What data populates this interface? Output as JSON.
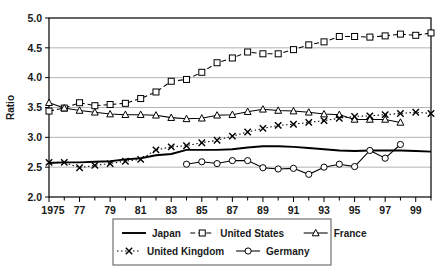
{
  "chart_data": {
    "type": "line",
    "title": "",
    "xlabel": "",
    "ylabel": "Ratio",
    "xlim": [
      1975,
      2000
    ],
    "ylim": [
      2.0,
      5.0
    ],
    "grid": true,
    "legend_position": "bottom",
    "ytick_labels": [
      "5.0",
      "4.5",
      "4.0",
      "3.5",
      "3.0",
      "2.5",
      "2.0"
    ],
    "yticks": [
      5.0,
      4.5,
      4.0,
      3.5,
      3.0,
      2.5,
      2.0
    ],
    "xtick_labels": [
      "1975",
      "77",
      "79",
      "81",
      "83",
      "85",
      "87",
      "89",
      "91",
      "93",
      "95",
      "97",
      "99"
    ],
    "xticks": [
      1975,
      1977,
      1979,
      1981,
      1983,
      1985,
      1987,
      1989,
      1991,
      1993,
      1995,
      1997,
      1999
    ],
    "xticks_minor": [
      1976,
      1978,
      1980,
      1982,
      1984,
      1986,
      1988,
      1990,
      1992,
      1994,
      1996,
      1998,
      2000
    ],
    "series": [
      {
        "name": "Japan",
        "style": "solid",
        "marker": "none",
        "color": "#000000",
        "x": [
          1975,
          1976,
          1977,
          1978,
          1979,
          1980,
          1981,
          1982,
          1983,
          1984,
          1985,
          1986,
          1987,
          1988,
          1989,
          1990,
          1991,
          1992,
          1993,
          1994,
          1995,
          1996,
          1997,
          1998,
          1999,
          2000
        ],
        "values": [
          2.57,
          2.58,
          2.58,
          2.59,
          2.6,
          2.63,
          2.65,
          2.7,
          2.72,
          2.79,
          2.79,
          2.79,
          2.8,
          2.83,
          2.85,
          2.85,
          2.84,
          2.82,
          2.8,
          2.78,
          2.77,
          2.78,
          2.78,
          2.78,
          2.77,
          2.76
        ]
      },
      {
        "name": "United States",
        "style": "dashed",
        "marker": "square",
        "color": "#000000",
        "x": [
          1975,
          1976,
          1977,
          1978,
          1979,
          1980,
          1981,
          1982,
          1983,
          1984,
          1985,
          1986,
          1987,
          1988,
          1989,
          1990,
          1991,
          1992,
          1993,
          1994,
          1995,
          1996,
          1997,
          1998,
          1999,
          2000
        ],
        "values": [
          3.44,
          3.49,
          3.58,
          3.53,
          3.55,
          3.57,
          3.65,
          3.76,
          3.94,
          3.97,
          4.09,
          4.25,
          4.33,
          4.43,
          4.4,
          4.4,
          4.47,
          4.55,
          4.6,
          4.69,
          4.69,
          4.68,
          4.7,
          4.73,
          4.71,
          4.75
        ]
      },
      {
        "name": "France",
        "style": "solid",
        "marker": "triangle",
        "color": "#000000",
        "x": [
          1975,
          1976,
          1977,
          1978,
          1979,
          1980,
          1981,
          1982,
          1983,
          1984,
          1985,
          1986,
          1987,
          1988,
          1989,
          1990,
          1991,
          1992,
          1993,
          1994,
          1995,
          1996,
          1997,
          1998
        ],
        "values": [
          3.58,
          3.49,
          3.45,
          3.42,
          3.39,
          3.38,
          3.38,
          3.37,
          3.33,
          3.31,
          3.32,
          3.37,
          3.38,
          3.43,
          3.47,
          3.45,
          3.44,
          3.42,
          3.39,
          3.38,
          3.3,
          3.3,
          3.3,
          3.25
        ]
      },
      {
        "name": "United Kingdom",
        "style": "dotted-dash",
        "marker": "x",
        "color": "#000000",
        "x": [
          1975,
          1976,
          1977,
          1978,
          1979,
          1980,
          1981,
          1982,
          1983,
          1984,
          1985,
          1986,
          1987,
          1988,
          1989,
          1990,
          1991,
          1992,
          1993,
          1994,
          1995,
          1996,
          1997,
          1998,
          1999,
          2000
        ],
        "values": [
          2.58,
          2.58,
          2.49,
          2.53,
          2.56,
          2.6,
          2.63,
          2.79,
          2.84,
          2.86,
          2.91,
          2.95,
          3.02,
          3.09,
          3.15,
          3.2,
          3.22,
          3.25,
          3.28,
          3.32,
          3.35,
          3.36,
          3.38,
          3.4,
          3.42,
          3.4
        ]
      },
      {
        "name": "Germany",
        "style": "solid",
        "marker": "circle",
        "color": "#000000",
        "x": [
          1984,
          1985,
          1986,
          1987,
          1988,
          1989,
          1990,
          1991,
          1992,
          1993,
          1994,
          1995,
          1996,
          1997,
          1998
        ],
        "values": [
          2.55,
          2.59,
          2.56,
          2.61,
          2.61,
          2.49,
          2.47,
          2.48,
          2.38,
          2.5,
          2.55,
          2.51,
          2.78,
          2.65,
          2.88
        ]
      }
    ]
  },
  "legend": {
    "rows": [
      [
        {
          "label": "Japan",
          "key": "japan"
        },
        {
          "label": "United States",
          "key": "united-states"
        },
        {
          "label": "France",
          "key": "france"
        }
      ],
      [
        {
          "label": "United Kingdom",
          "key": "united-kingdom"
        },
        {
          "label": "Germany",
          "key": "germany"
        }
      ]
    ]
  },
  "colors": {
    "line": "#000000",
    "grid": "#aaaaaa",
    "axis": "#000000",
    "background": "#ffffff"
  }
}
